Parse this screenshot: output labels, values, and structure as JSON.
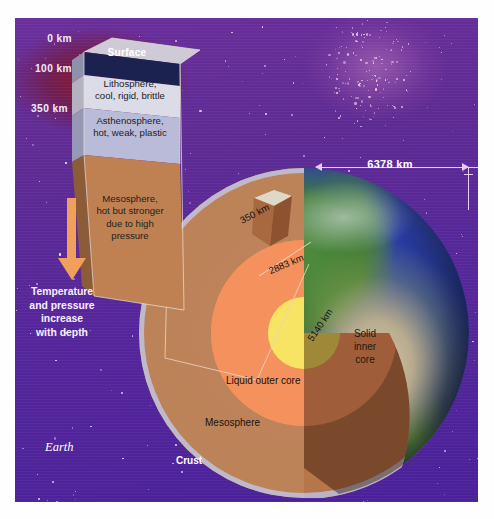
{
  "figure": {
    "earth_label": "Earth"
  },
  "depth_scale": {
    "ticks": [
      "0 km",
      "100 km",
      "350 km"
    ]
  },
  "gradient_note": {
    "text": "Temperature and pressure increase with depth",
    "line1": "Temperature",
    "line2": "and pressure",
    "line3": "increase",
    "line4": "with depth",
    "arrow": "down-arrow-icon",
    "arrow_color": "#f0a05a"
  },
  "prism": {
    "layers": [
      {
        "name": "Surface",
        "label": "Surface",
        "color": "#1b2250"
      },
      {
        "name": "Lithosphere",
        "label_line1": "Lithosphere,",
        "label_line2": "cool, rigid, brittle",
        "color": "#dcdbe8"
      },
      {
        "name": "Asthenosphere",
        "label_line1": "Asthenosphere,",
        "label_line2": "hot, weak, plastic",
        "color": "#b9bbd8"
      },
      {
        "name": "Mesosphere",
        "label_line1": "Mesosphere,",
        "label_line2": "hot but stronger",
        "label_line3": "due to high",
        "label_line4": "pressure",
        "color": "#c08152"
      }
    ]
  },
  "interior_labels": {
    "depth_350": "350 km",
    "depth_2883": "2883 km",
    "depth_5140": "5140 km",
    "inner_core_l1": "Solid",
    "inner_core_l2": "inner",
    "inner_core_l3": "core",
    "outer_core": "Liquid outer core",
    "mesosphere": "Mesosphere",
    "crust": "Crust"
  },
  "dimension": {
    "radius_label": "6378 km",
    "line_color": "#e8cdf3"
  },
  "colors": {
    "space_purple": "#57269a",
    "nebula_red": "#961419",
    "mesosphere_brown": "#b5764a",
    "mesosphere_shadow": "#7e3d22",
    "outer_core_orange": "#f4834f",
    "outer_core_light": "#f79a63",
    "inner_core_yellow": "#f7e463",
    "crust_grey": "#b9b4c8",
    "ocean_blue": "#2b3fa8",
    "land_green": "#4f8a3c"
  }
}
